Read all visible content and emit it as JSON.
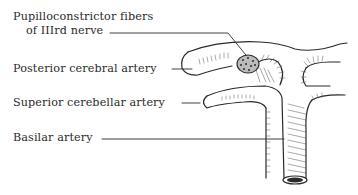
{
  "diagram": {
    "type": "anatomical illustration",
    "labels": [
      {
        "id": "pupilloconstrictor",
        "line1": "Pupilloconstrictor fibers",
        "line2": "of IIIrd nerve"
      },
      {
        "id": "posterior-cerebral",
        "text": "Posterior cerebral artery"
      },
      {
        "id": "superior-cerebellar",
        "text": "Superior cerebellar artery"
      },
      {
        "id": "basilar",
        "text": "Basilar artery"
      }
    ],
    "colors": {
      "ink": "#2a2a2a",
      "background": "#ffffff"
    }
  }
}
